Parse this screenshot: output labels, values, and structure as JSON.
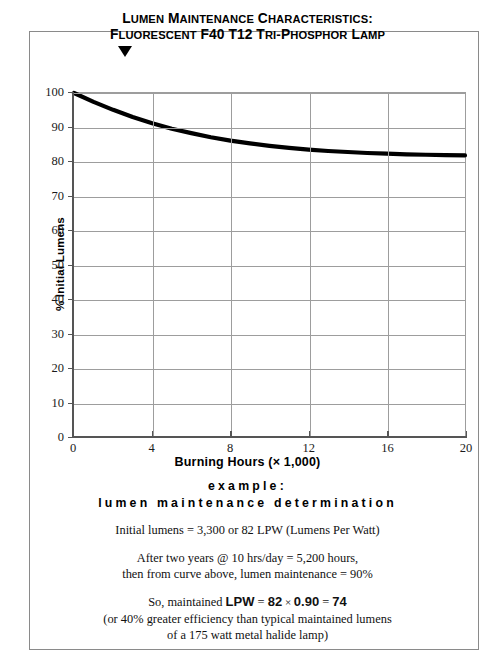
{
  "title": {
    "line1": "Lumen Maintenance Characteristics:",
    "line2": "Fluorescent F40 T12 Tri-Phosphor Lamp",
    "marker": "down-triangle-marker"
  },
  "chart_data": {
    "type": "line",
    "title": "Lumen Maintenance Characteristics: Fluorescent F40 T12 Tri-Phosphor Lamp",
    "xlabel": "Burning Hours (× 1,000)",
    "ylabel": "% Initial Lumens",
    "xlim": [
      0,
      20
    ],
    "ylim": [
      0,
      100
    ],
    "grid": true,
    "legend": "none",
    "xticks": [
      0,
      4,
      8,
      12,
      16,
      20
    ],
    "yticks": [
      0,
      10,
      20,
      30,
      40,
      50,
      60,
      70,
      80,
      90,
      100
    ],
    "series": [
      {
        "name": "Lumen maintenance",
        "x": [
          0,
          1,
          2,
          3,
          4,
          5,
          6,
          7,
          8,
          9,
          10,
          11,
          12,
          13,
          14,
          15,
          16,
          17,
          18,
          19,
          20
        ],
        "values": [
          100,
          97.4,
          95.1,
          93.0,
          91.2,
          89.6,
          88.3,
          87.1,
          86.1,
          85.3,
          84.6,
          84.0,
          83.5,
          83.1,
          82.8,
          82.5,
          82.3,
          82.1,
          82.0,
          81.9,
          81.8
        ]
      }
    ],
    "line_color": "#000000",
    "grid_color": "#9d9d9d",
    "background": "#ffffff"
  },
  "axes": {
    "x_tick_labels": [
      "0",
      "4",
      "8",
      "12",
      "16",
      "20"
    ],
    "y_tick_labels": [
      "0",
      "10",
      "20",
      "30",
      "40",
      "50",
      "60",
      "70",
      "80",
      "90",
      "100"
    ],
    "x_axis_label": "Burning Hours (× 1,000)",
    "y_axis_label": "% Initial Lumens"
  },
  "example": {
    "heading_1": "example:",
    "heading_2": "lumen maintenance determination",
    "line_1": "Initial lumens = 3,300 or 82 LPW (Lumens Per Watt)",
    "line_2": "After two years @ 10 hrs/day = 5,200 hours,",
    "line_3": "then from curve above, lumen maintenance = 90%",
    "line_4_prefix": "So, maintained ",
    "line_4_lpw": "LPW",
    "line_4_eq1": " = ",
    "line_4_val1": "82",
    "line_4_times": " × ",
    "line_4_val2": "0.90",
    "line_4_eq2": " = ",
    "line_4_result": "74",
    "line_5": "(or 40% greater efficiency than typical maintained lumens",
    "line_6": "of a 175 watt metal halide lamp)"
  }
}
